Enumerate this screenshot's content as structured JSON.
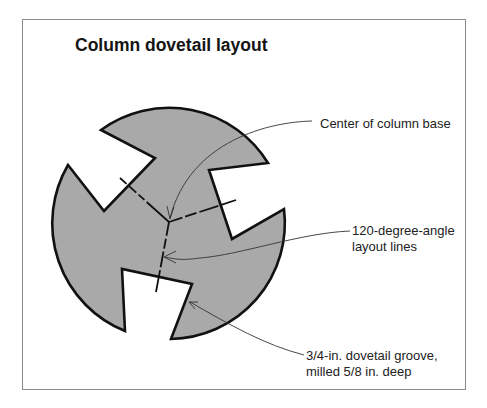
{
  "figure": {
    "title": "Column dovetail layout",
    "colors": {
      "fill": "#a9a9a9",
      "outline": "#111111",
      "leader": "#333333",
      "frame": "#8a8a8a"
    },
    "callouts": [
      {
        "id": "center",
        "lines": [
          "Center of column base"
        ]
      },
      {
        "id": "layout-lines",
        "lines": [
          "120-degree-angle",
          "layout lines"
        ]
      },
      {
        "id": "groove",
        "lines": [
          "3/4-in. dovetail groove,",
          "milled 5/8 in. deep"
        ]
      }
    ]
  }
}
